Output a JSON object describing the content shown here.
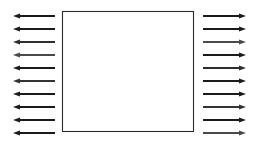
{
  "canvas": {
    "width": 259,
    "height": 143,
    "background": "#ffffff"
  },
  "diagram": {
    "stroke_color": "#1f1f1f",
    "stroke_width": 1
  },
  "plate": {
    "name": "square-plate",
    "x": 62.5,
    "y": 11.5,
    "width": 131,
    "height": 120,
    "fill": "#ffffff",
    "stroke": "#2b2b2b",
    "stroke_width": 1.1
  },
  "arrow_geometry": {
    "count_per_side": 10,
    "first_y": 16,
    "spacing_y": 13,
    "left": {
      "tail_x": 55,
      "tip_x": 13,
      "direction": "left"
    },
    "right": {
      "tail_x": 203,
      "tip_x": 246,
      "direction": "right"
    },
    "head_length": 7,
    "head_half_width": 2.6,
    "shaft_width": 1.1
  },
  "arrows": {
    "left_label": "left-pointing load arrows",
    "right_label": "right-pointing load arrows",
    "left_rows": [
      {
        "index": 1,
        "y": 16,
        "color": "#1a1a1a"
      },
      {
        "index": 2,
        "y": 29,
        "color": "#1a1a1a"
      },
      {
        "index": 3,
        "y": 42,
        "color": "#2e2e2e"
      },
      {
        "index": 4,
        "y": 55,
        "color": "#4a4a4a"
      },
      {
        "index": 5,
        "y": 68,
        "color": "#1a1a1a"
      },
      {
        "index": 6,
        "y": 81,
        "color": "#333333"
      },
      {
        "index": 7,
        "y": 94,
        "color": "#1a1a1a"
      },
      {
        "index": 8,
        "y": 107,
        "color": "#1a1a1a"
      },
      {
        "index": 9,
        "y": 120,
        "color": "#1a1a1a"
      },
      {
        "index": 10,
        "y": 133,
        "color": "#1a1a1a"
      }
    ],
    "right_rows": [
      {
        "index": 1,
        "y": 16,
        "color": "#1a1a1a"
      },
      {
        "index": 2,
        "y": 29,
        "color": "#1a1a1a"
      },
      {
        "index": 3,
        "y": 42,
        "color": "#4a4a4a"
      },
      {
        "index": 4,
        "y": 55,
        "color": "#1a1a1a"
      },
      {
        "index": 5,
        "y": 68,
        "color": "#2e2e2e"
      },
      {
        "index": 6,
        "y": 81,
        "color": "#1a1a1a"
      },
      {
        "index": 7,
        "y": 94,
        "color": "#1a1a1a"
      },
      {
        "index": 8,
        "y": 107,
        "color": "#333333"
      },
      {
        "index": 9,
        "y": 120,
        "color": "#1a1a1a"
      },
      {
        "index": 10,
        "y": 133,
        "color": "#4a4a4a"
      }
    ]
  }
}
